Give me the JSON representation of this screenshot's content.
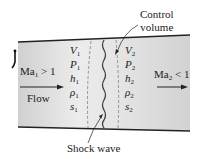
{
  "diagram": {
    "type": "normal-shock-control-volume",
    "colors": {
      "duct_fill_light": "#e8e8e8",
      "duct_fill_dark": "#cfcfcf",
      "wall": "#222222",
      "dashed": "#888888",
      "shock": "#444444",
      "text": "#222222"
    },
    "labels": {
      "control_volume_line1": "Control",
      "control_volume_line2": "volume",
      "shock_wave": "Shock wave",
      "flow": "Flow",
      "upstream_mach_base": "Ma",
      "upstream_mach_sub": "1",
      "upstream_mach_rel": " > 1",
      "downstream_mach_base": "Ma",
      "downstream_mach_sub": "2",
      "downstream_mach_rel": " < 1"
    },
    "upstream_properties": [
      {
        "symbol": "V",
        "sub": "1"
      },
      {
        "symbol": "P",
        "sub": "1"
      },
      {
        "symbol": "h",
        "sub": "1"
      },
      {
        "symbol": "ρ",
        "sub": "1"
      },
      {
        "symbol": "s",
        "sub": "1"
      }
    ],
    "downstream_properties": [
      {
        "symbol": "V",
        "sub": "2"
      },
      {
        "symbol": "P",
        "sub": "2"
      },
      {
        "symbol": "h",
        "sub": "2"
      },
      {
        "symbol": "ρ",
        "sub": "2"
      },
      {
        "symbol": "s",
        "sub": "2"
      }
    ]
  }
}
